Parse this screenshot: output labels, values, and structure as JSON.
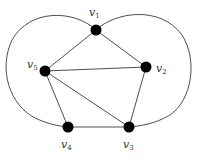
{
  "diagram": {
    "type": "graph",
    "nodes": [
      {
        "id": "v1",
        "label": "v",
        "sub": "1",
        "x": 96,
        "y": 30,
        "lx": 89,
        "ly": 16
      },
      {
        "id": "v2",
        "label": "v",
        "sub": "2",
        "x": 146,
        "y": 67,
        "lx": 156,
        "ly": 72
      },
      {
        "id": "v3",
        "label": "v",
        "sub": "3",
        "x": 129,
        "y": 127,
        "lx": 123,
        "ly": 148
      },
      {
        "id": "v4",
        "label": "v",
        "sub": "4",
        "x": 68,
        "y": 127,
        "lx": 61,
        "ly": 148
      },
      {
        "id": "v5",
        "label": "v",
        "sub": "5",
        "x": 45,
        "y": 71,
        "lx": 27,
        "ly": 68
      }
    ],
    "edges": [
      {
        "from": "v1",
        "to": "v2"
      },
      {
        "from": "v1",
        "to": "v5"
      },
      {
        "from": "v5",
        "to": "v2"
      },
      {
        "from": "v5",
        "to": "v4"
      },
      {
        "from": "v5",
        "to": "v3"
      },
      {
        "from": "v2",
        "to": "v3"
      },
      {
        "from": "v4",
        "to": "v3"
      },
      {
        "from": "v1",
        "to": "v4",
        "curved": true,
        "side": "left"
      },
      {
        "from": "v1",
        "to": "v3",
        "curved": true,
        "side": "right"
      }
    ],
    "colors": {
      "node": "#000000",
      "edge": "#3a3a3a",
      "label": "#333333"
    }
  }
}
